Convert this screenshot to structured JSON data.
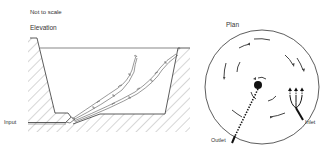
{
  "diagram": {
    "note": "Not to scale",
    "elevation": {
      "title": "Elevation",
      "labels": {
        "input": "Input"
      }
    },
    "plan": {
      "title": "Plan",
      "labels": {
        "outlet": "Outlet",
        "inlet": "Inlet"
      }
    },
    "colors": {
      "line": "#333333",
      "hatch": "#8a8a8a",
      "background": "#ffffff"
    }
  }
}
